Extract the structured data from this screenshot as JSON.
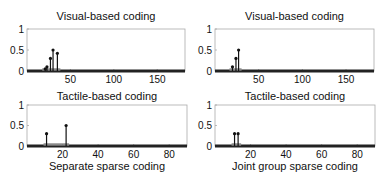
{
  "chart_data": [
    {
      "type": "stem",
      "title": "Visual-based coding",
      "xlabel": "",
      "ylabel": "",
      "xlim": [
        0,
        182
      ],
      "ylim": [
        0,
        1
      ],
      "xticks": [
        50,
        100,
        150
      ],
      "yticks": [
        0,
        0.5,
        1
      ],
      "points": [
        {
          "x": 21,
          "y": 0.05
        },
        {
          "x": 23,
          "y": 0.1
        },
        {
          "x": 27,
          "y": 0.3
        },
        {
          "x": 30,
          "y": 0.5
        },
        {
          "x": 35,
          "y": 0.42
        }
      ]
    },
    {
      "type": "stem",
      "title": "Visual-based coding",
      "xlabel": "",
      "ylabel": "",
      "xlim": [
        0,
        182
      ],
      "ylim": [
        0,
        1
      ],
      "xticks": [
        50,
        100,
        150
      ],
      "yticks": [
        0,
        0.5,
        1
      ],
      "points": [
        {
          "x": 20,
          "y": 0.1
        },
        {
          "x": 24,
          "y": 0.3
        },
        {
          "x": 27,
          "y": 0.5
        }
      ]
    },
    {
      "type": "stem",
      "title": "Tactile-based coding",
      "xlabel": "Separate sparse coding",
      "ylabel": "",
      "xlim": [
        0,
        90
      ],
      "ylim": [
        0,
        1
      ],
      "xticks": [
        20,
        40,
        60,
        80
      ],
      "yticks": [
        0,
        0.5,
        1
      ],
      "points": [
        {
          "x": 11,
          "y": 0.3
        },
        {
          "x": 22,
          "y": 0.5
        }
      ]
    },
    {
      "type": "stem",
      "title": "Tactile-based coding",
      "xlabel": "Joint group sparse coding",
      "ylabel": "",
      "xlim": [
        0,
        90
      ],
      "ylim": [
        0,
        1
      ],
      "xticks": [
        20,
        40,
        60,
        80
      ],
      "yticks": [
        0,
        0.5,
        1
      ],
      "points": [
        {
          "x": 11,
          "y": 0.3
        },
        {
          "x": 13,
          "y": 0.3
        }
      ]
    }
  ],
  "labels": {
    "tl_title": "Visual-based coding",
    "tr_title": "Visual-based coding",
    "bl_title": "Tactile-based coding",
    "br_title": "Tactile-based coding",
    "bl_xlabel": "Separate sparse coding",
    "br_xlabel": "Joint group sparse coding"
  },
  "colors": {
    "axis": "#aaaaaa",
    "stem": "#111111",
    "baseline": "#222222"
  }
}
